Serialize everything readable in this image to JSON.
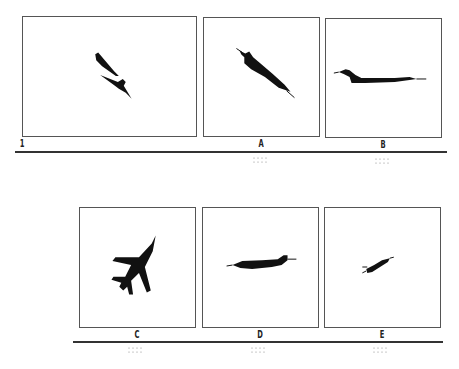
{
  "panels": [
    {
      "id": "1",
      "label": "1",
      "kind": "reference",
      "subject": "two-aircraft-silhouettes-diagonal"
    },
    {
      "id": "A",
      "label": "A",
      "kind": "option",
      "subject": "jet-silhouette-diving-right"
    },
    {
      "id": "B",
      "label": "B",
      "kind": "option",
      "subject": "jet-silhouette-side-facing-left"
    },
    {
      "id": "C",
      "label": "C",
      "kind": "option",
      "subject": "jet-silhouette-top-view"
    },
    {
      "id": "D",
      "label": "D",
      "kind": "option",
      "subject": "jet-silhouette-side-facing-right"
    },
    {
      "id": "E",
      "label": "E",
      "kind": "option",
      "subject": "jet-silhouette-small-climbing"
    }
  ],
  "colors": {
    "ink": "#111111",
    "frame": "#555555",
    "rule": "#333333",
    "dots": "#888888"
  }
}
